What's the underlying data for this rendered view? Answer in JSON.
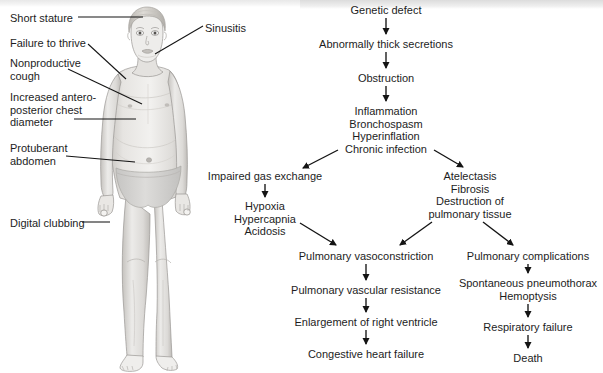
{
  "figure": {
    "alt_name": "child-with-cystic-fibrosis-illustration",
    "skin_tone": "#e9e7e4",
    "shade_tone": "#c9c7c4",
    "line_tone": "#8d8b88",
    "garment_tone": "#d8d7d5"
  },
  "callouts": [
    {
      "id": "short-stature",
      "text": "Short stature",
      "x": 10,
      "y": 12
    },
    {
      "id": "failure-to-thrive",
      "text": "Failure to thrive",
      "x": 10,
      "y": 37
    },
    {
      "id": "nonproductive-cough",
      "text": "Nonproductive\ncough",
      "x": 10,
      "y": 57
    },
    {
      "id": "ap-chest-diameter",
      "text": "Increased antero-\nposterior chest\ndiameter",
      "x": 10,
      "y": 91
    },
    {
      "id": "protuberant-abdomen",
      "text": "Protuberant\nabdomen",
      "x": 10,
      "y": 142
    },
    {
      "id": "digital-clubbing",
      "text": "Digital clubbing",
      "x": 10,
      "y": 217
    },
    {
      "id": "sinusitis",
      "text": "Sinusitis",
      "x": 205,
      "y": 22
    }
  ],
  "flowchart": {
    "title": "Pathophysiology of cystic fibrosis",
    "nodes": [
      {
        "id": "genetic-defect",
        "text": "Genetic defect",
        "cx": 386,
        "y": 4
      },
      {
        "id": "thick-secretions",
        "text": "Abnormally thick secretions",
        "cx": 386,
        "y": 38
      },
      {
        "id": "obstruction",
        "text": "Obstruction",
        "cx": 386,
        "y": 72
      },
      {
        "id": "inflammation-group",
        "text": "Inflammation\nBronchospasm\nHyperinflation\nChronic infection",
        "cx": 386,
        "y": 105
      },
      {
        "id": "impaired-gas-exchange",
        "text": "Impaired gas exchange",
        "cx": 265,
        "y": 170
      },
      {
        "id": "hypoxia-group",
        "text": "Hypoxia\nHypercapnia\nAcidosis",
        "cx": 265,
        "y": 200
      },
      {
        "id": "atelectasis-group",
        "text": "Atelectasis\nFibrosis\nDestruction of\npulmonary tissue",
        "cx": 470,
        "y": 170
      },
      {
        "id": "pulmonary-vasoconstriction",
        "text": "Pulmonary vasoconstriction",
        "cx": 366,
        "y": 250
      },
      {
        "id": "pulmonary-vascular-resistance",
        "text": "Pulmonary vascular resistance",
        "cx": 366,
        "y": 284
      },
      {
        "id": "enlargement-right-ventricle",
        "text": "Enlargement of right ventricle",
        "cx": 366,
        "y": 316
      },
      {
        "id": "congestive-heart-failure",
        "text": "Congestive heart failure",
        "cx": 366,
        "y": 348
      },
      {
        "id": "pulmonary-complications",
        "text": "Pulmonary complications",
        "cx": 528,
        "y": 250
      },
      {
        "id": "pneumothorax-group",
        "text": "Spontaneous pneumothorax\nHemoptysis",
        "cx": 528,
        "y": 277
      },
      {
        "id": "respiratory-failure",
        "text": "Respiratory failure",
        "cx": 528,
        "y": 321
      },
      {
        "id": "death",
        "text": "Death",
        "cx": 528,
        "y": 352
      }
    ],
    "edges": [
      {
        "id": "edge-genetic-to-secretions",
        "from": "genetic-defect",
        "to": "thick-secretions"
      },
      {
        "id": "edge-secretions-to-obstruction",
        "from": "thick-secretions",
        "to": "obstruction"
      },
      {
        "id": "edge-obstruction-to-inflammation",
        "from": "obstruction",
        "to": "inflammation-group"
      },
      {
        "id": "edge-inflammation-to-gas-exchange",
        "from": "inflammation-group",
        "to": "impaired-gas-exchange"
      },
      {
        "id": "edge-inflammation-to-atelectasis",
        "from": "inflammation-group",
        "to": "atelectasis-group"
      },
      {
        "id": "edge-gas-exchange-to-hypoxia",
        "from": "impaired-gas-exchange",
        "to": "hypoxia-group"
      },
      {
        "id": "edge-hypoxia-to-vasoconstriction",
        "from": "hypoxia-group",
        "to": "pulmonary-vasoconstriction"
      },
      {
        "id": "edge-atelectasis-to-vasoconstriction",
        "from": "atelectasis-group",
        "to": "pulmonary-vasoconstriction"
      },
      {
        "id": "edge-atelectasis-to-complications",
        "from": "atelectasis-group",
        "to": "pulmonary-complications"
      },
      {
        "id": "edge-vasoconstriction-to-resistance",
        "from": "pulmonary-vasoconstriction",
        "to": "pulmonary-vascular-resistance"
      },
      {
        "id": "edge-resistance-to-ventricle",
        "from": "pulmonary-vascular-resistance",
        "to": "enlargement-right-ventricle"
      },
      {
        "id": "edge-ventricle-to-heart-failure",
        "from": "enlargement-right-ventricle",
        "to": "congestive-heart-failure"
      },
      {
        "id": "edge-complications-to-pneumothorax",
        "from": "pulmonary-complications",
        "to": "pneumothorax-group"
      },
      {
        "id": "edge-pneumothorax-to-respiratory-failure",
        "from": "pneumothorax-group",
        "to": "respiratory-failure"
      },
      {
        "id": "edge-respiratory-failure-to-death",
        "from": "respiratory-failure",
        "to": "death"
      }
    ]
  },
  "colors": {
    "text": "#1d1d1d",
    "arrow": "#141414",
    "leader_line": "#141414",
    "background": "#ffffff"
  }
}
